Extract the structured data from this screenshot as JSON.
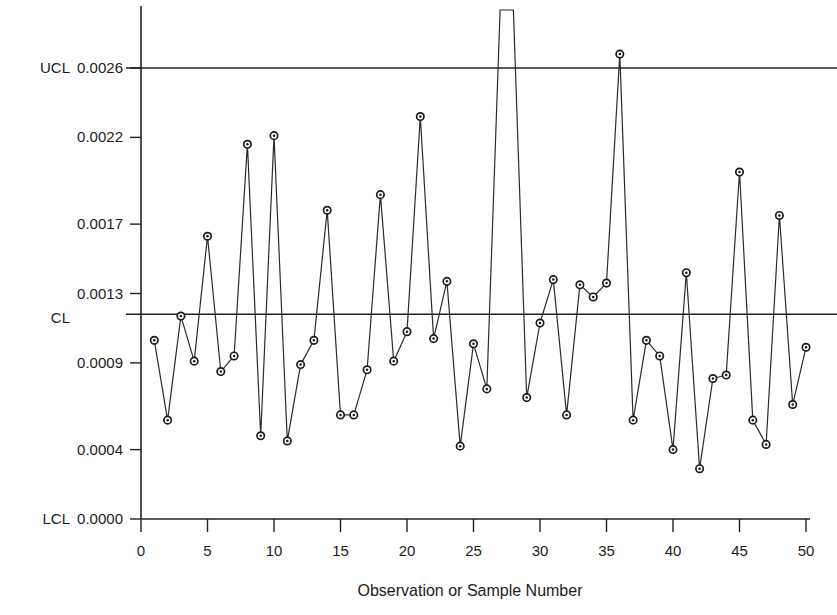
{
  "chart_data": {
    "type": "line",
    "title": "",
    "subtitle": "",
    "xlabel": "Observation or Sample Number",
    "ylabel": "",
    "grid": false,
    "legend": null,
    "xlim": [
      0,
      50.6
    ],
    "ylim": [
      0.0,
      0.00277
    ],
    "x_ticks": [
      0,
      5,
      10,
      15,
      20,
      25,
      30,
      35,
      40,
      45,
      50
    ],
    "x_tick_labels": [
      "0",
      "5",
      "10",
      "15",
      "20",
      "25",
      "30",
      "35",
      "40",
      "45",
      "50"
    ],
    "y_ticks": [
      0.0026,
      0.0022,
      0.0017,
      0.0013,
      0.0009,
      0.0004,
      0.0
    ],
    "y_tick_labels": [
      "0.0026",
      "0.0022",
      "0.0017",
      "0.0013",
      "0.0009",
      "0.0004",
      "0.0000"
    ],
    "control_limits": {
      "ucl": {
        "label": "UCL",
        "value_label": "0.0026",
        "value": 0.0026
      },
      "cl": {
        "label": "CL",
        "value_label": "",
        "value": 0.00118
      },
      "lcl": {
        "label": "LCL",
        "value_label": "0.0000",
        "value": 0.0
      }
    },
    "x": [
      1,
      2,
      3,
      4,
      5,
      6,
      7,
      8,
      9,
      10,
      11,
      12,
      13,
      14,
      15,
      16,
      17,
      18,
      19,
      20,
      21,
      22,
      23,
      24,
      25,
      26,
      27,
      28,
      29,
      30,
      31,
      32,
      33,
      34,
      35,
      36,
      37,
      38,
      39,
      40,
      41,
      42,
      43,
      44,
      45,
      46,
      47,
      48,
      49,
      50
    ],
    "values": [
      0.00103,
      0.00057,
      0.00117,
      0.00091,
      0.00163,
      0.00085,
      0.00094,
      0.00216,
      0.00048,
      0.00221,
      0.00045,
      0.00089,
      0.00103,
      0.00178,
      0.0006,
      0.0006,
      0.00086,
      0.00187,
      0.00091,
      0.00108,
      0.00232,
      0.00104,
      0.00137,
      0.00042,
      0.00101,
      0.00075,
      0.0033,
      0.0032,
      0.0007,
      0.00113,
      0.00138,
      0.0006,
      0.00135,
      0.00128,
      0.00136,
      0.00268,
      0.00057,
      0.00103,
      0.00094,
      0.0004,
      0.00142,
      0.00029,
      0.00081,
      0.00083,
      0.002,
      0.00057,
      0.00043,
      0.00175,
      0.00066,
      0.00099
    ],
    "offscale_points": [
      27,
      28
    ],
    "offscale_note": "points 27 and 28 exceed the top of the plotting region",
    "marker": "open-circle-with-dot",
    "line_color": "#2b2b2b",
    "marker_color": "#1a1a1a"
  },
  "axis_titles": {
    "x": "Observation or Sample Number"
  }
}
